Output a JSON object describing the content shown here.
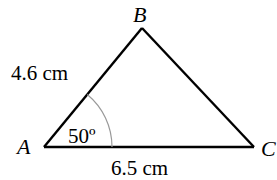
{
  "diagram": {
    "type": "triangle",
    "vertices": [
      {
        "id": "A",
        "label": "A"
      },
      {
        "id": "B",
        "label": "B"
      },
      {
        "id": "C",
        "label": "C"
      }
    ],
    "sides": {
      "AB": {
        "label": "4.6 cm"
      },
      "AC": {
        "label": "6.5 cm"
      }
    },
    "angles": {
      "A": {
        "label": "50º"
      }
    },
    "colors": {
      "stroke": "#000000",
      "arc": "#999999",
      "background": "#ffffff"
    }
  }
}
